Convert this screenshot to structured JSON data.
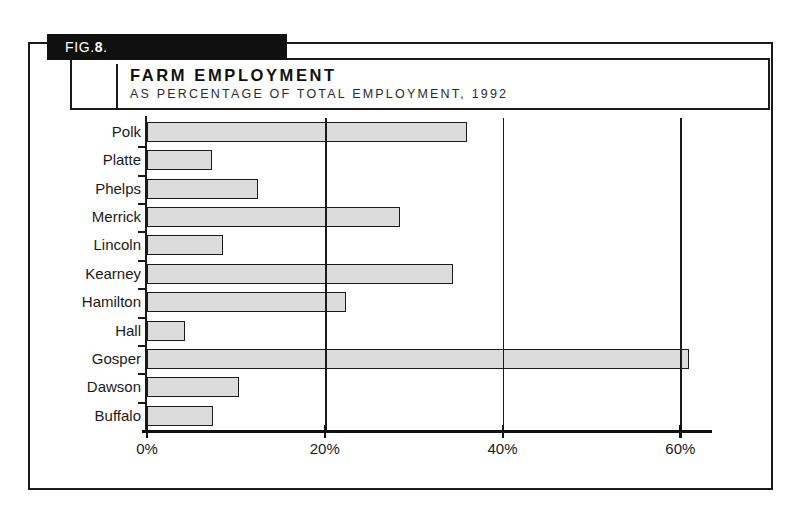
{
  "figure": {
    "tag_label": "FIG.8.",
    "tag_prefix": "FIG.",
    "tag_number": "8",
    "tag_suffix": "."
  },
  "header": {
    "title": "FARM EMPLOYMENT",
    "subtitle": "AS PERCENTAGE OF TOTAL EMPLOYMENT, 1992"
  },
  "colors": {
    "bar_fill": "#dcdcdc",
    "bar_stroke": "#1a1a1a",
    "frame": "#1a1a1a",
    "tab_background": "#101010",
    "tab_text": "#ffffff"
  },
  "chart_data": {
    "type": "bar",
    "orientation": "horizontal",
    "title": "FARM EMPLOYMENT",
    "subtitle": "AS PERCENTAGE OF TOTAL EMPLOYMENT, 1992",
    "xlabel": "",
    "ylabel": "",
    "categories": [
      "Polk",
      "Platte",
      "Phelps",
      "Merrick",
      "Lincoln",
      "Kearney",
      "Hamilton",
      "Hall",
      "Gosper",
      "Dawson",
      "Buffalo"
    ],
    "values": [
      36.0,
      7.3,
      12.5,
      28.5,
      8.5,
      34.4,
      22.4,
      4.3,
      61.0,
      10.3,
      7.4
    ],
    "xlim": [
      0,
      63
    ],
    "xticks": [
      0,
      20,
      40,
      60
    ],
    "xticklabels": [
      "0%",
      "20%",
      "40%",
      "60%"
    ],
    "grid": true,
    "grid_axis": "x",
    "legend": false,
    "units": "percent"
  }
}
